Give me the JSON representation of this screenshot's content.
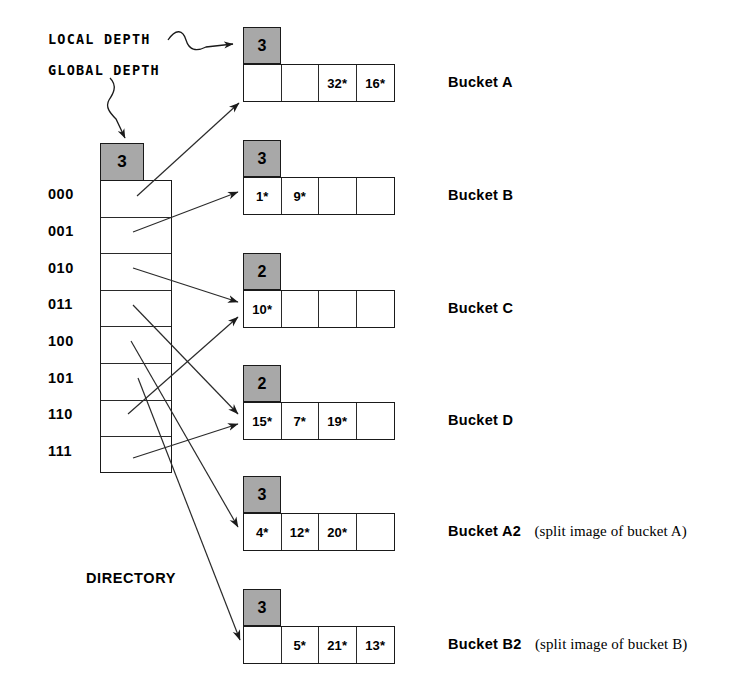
{
  "annotations": {
    "local_depth": "LOCAL DEPTH",
    "global_depth": "GLOBAL DEPTH"
  },
  "directory": {
    "label": "DIRECTORY",
    "global_depth": "3",
    "indexes": [
      "000",
      "001",
      "010",
      "011",
      "100",
      "101",
      "110",
      "111"
    ]
  },
  "buckets": [
    {
      "name": "Bucket A",
      "note": "",
      "local_depth": "3",
      "cells": [
        "",
        "",
        "32*",
        "16*"
      ]
    },
    {
      "name": "Bucket B",
      "note": "",
      "local_depth": "3",
      "cells": [
        "1*",
        "9*",
        "",
        ""
      ]
    },
    {
      "name": "Bucket C",
      "note": "",
      "local_depth": "2",
      "cells": [
        "10*",
        "",
        "",
        ""
      ]
    },
    {
      "name": "Bucket D",
      "note": "",
      "local_depth": "2",
      "cells": [
        "15*",
        "7*",
        "19*",
        ""
      ]
    },
    {
      "name": "Bucket A2",
      "note": "(split image of bucket A)",
      "local_depth": "3",
      "cells": [
        "4*",
        "12*",
        "20*",
        ""
      ]
    },
    {
      "name": "Bucket B2",
      "note": "(split image of bucket B)",
      "local_depth": "3",
      "cells": [
        "",
        "5*",
        "21*",
        "13*"
      ]
    }
  ],
  "colors": {
    "depth_fill": "#a8a8a8",
    "stroke": "#1a1a1a",
    "background": "#ffffff"
  }
}
